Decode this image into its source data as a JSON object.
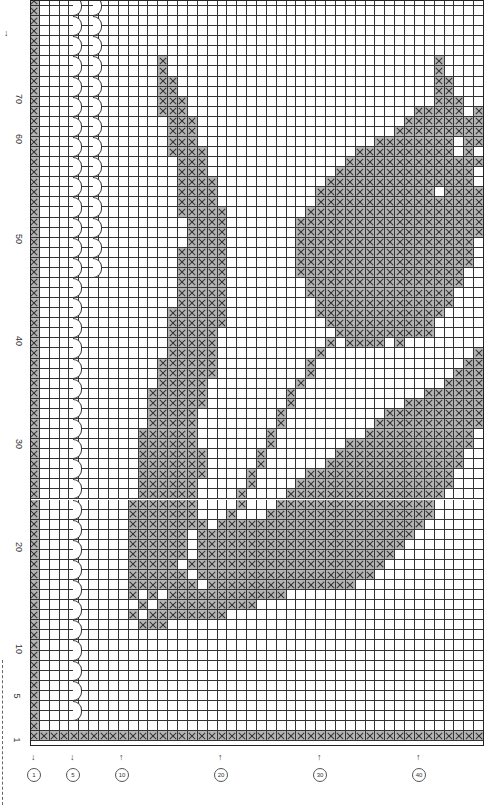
{
  "chart": {
    "cols": 46,
    "rows": 74,
    "cell_w": 9.87,
    "cell_h": 10.07,
    "fill_color": "#b4b4b4",
    "line_color": "#333333",
    "row_labels": [
      {
        "text": "70",
        "y": 100
      },
      {
        "text": "60",
        "y": 140
      },
      {
        "text": "50",
        "y": 240
      },
      {
        "text": "40",
        "y": 342
      },
      {
        "text": "30",
        "y": 445
      },
      {
        "text": "20",
        "y": 548
      },
      {
        "text": "10",
        "y": 650
      },
      {
        "text": "5",
        "y": 697
      },
      {
        "text": "1",
        "y": 741
      }
    ],
    "col_labels": [
      {
        "text": "1",
        "x": 34,
        "dir": "↓"
      },
      {
        "text": "5",
        "x": 73,
        "dir": "↓"
      },
      {
        "text": "10",
        "x": 122,
        "dir": "↑"
      },
      {
        "text": "20",
        "x": 221,
        "dir": "↑"
      },
      {
        "text": "30",
        "x": 320,
        "dir": "↑"
      },
      {
        "text": "40",
        "x": 419,
        "dir": "↑"
      }
    ],
    "top_arrow": {
      "text": "↓",
      "x": 4,
      "y": 28
    },
    "arc_columns": [
      {
        "col": 5,
        "from_row": 0,
        "to_row": 71,
        "step": 2
      },
      {
        "col": 7,
        "from_row": 0,
        "to_row": 27,
        "step": 2
      }
    ],
    "filled": [
      [
        6,
        [
          [
            13,
            13
          ],
          [
            41,
            41
          ]
        ]
      ],
      [
        7,
        [
          [
            13,
            13
          ],
          [
            41,
            41
          ]
        ]
      ],
      [
        8,
        [
          [
            13,
            14
          ],
          [
            41,
            42
          ]
        ]
      ],
      [
        9,
        [
          [
            13,
            14
          ],
          [
            41,
            42
          ]
        ]
      ],
      [
        10,
        [
          [
            13,
            15
          ],
          [
            41,
            43
          ]
        ]
      ],
      [
        11,
        [
          [
            13,
            15
          ],
          [
            39,
            43
          ],
          [
            45,
            45
          ]
        ]
      ],
      [
        12,
        [
          [
            14,
            16
          ],
          [
            38,
            43
          ],
          [
            44,
            45
          ]
        ]
      ],
      [
        13,
        [
          [
            14,
            16
          ],
          [
            37,
            43
          ],
          [
            44,
            45
          ]
        ]
      ],
      [
        14,
        [
          [
            14,
            16
          ],
          [
            35,
            42
          ],
          [
            44,
            45
          ]
        ]
      ],
      [
        15,
        [
          [
            14,
            17
          ],
          [
            33,
            42
          ],
          [
            44,
            44
          ]
        ]
      ],
      [
        16,
        [
          [
            15,
            17
          ],
          [
            32,
            43
          ],
          [
            44,
            45
          ]
        ]
      ],
      [
        17,
        [
          [
            15,
            17
          ],
          [
            31,
            44
          ]
        ]
      ],
      [
        18,
        [
          [
            15,
            18
          ],
          [
            30,
            44
          ]
        ]
      ],
      [
        19,
        [
          [
            15,
            18
          ],
          [
            29,
            40
          ],
          [
            42,
            45
          ]
        ]
      ],
      [
        20,
        [
          [
            15,
            18
          ],
          [
            29,
            45
          ]
        ]
      ],
      [
        21,
        [
          [
            15,
            19
          ],
          [
            28,
            45
          ]
        ]
      ],
      [
        22,
        [
          [
            16,
            19
          ],
          [
            27,
            45
          ]
        ]
      ],
      [
        23,
        [
          [
            16,
            19
          ],
          [
            27,
            45
          ]
        ]
      ],
      [
        24,
        [
          [
            16,
            19
          ],
          [
            27,
            44
          ]
        ]
      ],
      [
        25,
        [
          [
            15,
            19
          ],
          [
            27,
            44
          ]
        ]
      ],
      [
        26,
        [
          [
            15,
            19
          ],
          [
            27,
            44
          ]
        ]
      ],
      [
        27,
        [
          [
            15,
            19
          ],
          [
            27,
            43
          ]
        ]
      ],
      [
        28,
        [
          [
            15,
            19
          ],
          [
            28,
            43
          ]
        ]
      ],
      [
        29,
        [
          [
            15,
            19
          ],
          [
            28,
            42
          ]
        ]
      ],
      [
        30,
        [
          [
            15,
            19
          ],
          [
            29,
            42
          ]
        ]
      ],
      [
        31,
        [
          [
            14,
            19
          ],
          [
            29,
            41
          ]
        ]
      ],
      [
        32,
        [
          [
            14,
            19
          ],
          [
            30,
            40
          ]
        ]
      ],
      [
        33,
        [
          [
            14,
            18
          ],
          [
            31,
            40
          ]
        ]
      ],
      [
        34,
        [
          [
            14,
            18
          ],
          [
            30,
            30
          ],
          [
            32,
            35
          ],
          [
            37,
            37
          ]
        ]
      ],
      [
        35,
        [
          [
            14,
            18
          ],
          [
            29,
            29
          ],
          [
            45,
            45
          ]
        ]
      ],
      [
        36,
        [
          [
            13,
            18
          ],
          [
            28,
            28
          ],
          [
            44,
            45
          ]
        ]
      ],
      [
        37,
        [
          [
            13,
            18
          ],
          [
            28,
            28
          ],
          [
            43,
            45
          ]
        ]
      ],
      [
        38,
        [
          [
            13,
            17
          ],
          [
            27,
            27
          ],
          [
            42,
            45
          ]
        ]
      ],
      [
        39,
        [
          [
            12,
            17
          ],
          [
            26,
            26
          ],
          [
            40,
            45
          ]
        ]
      ],
      [
        40,
        [
          [
            12,
            17
          ],
          [
            26,
            26
          ],
          [
            38,
            45
          ]
        ]
      ],
      [
        41,
        [
          [
            12,
            16
          ],
          [
            25,
            25
          ],
          [
            36,
            45
          ]
        ]
      ],
      [
        42,
        [
          [
            12,
            16
          ],
          [
            25,
            25
          ],
          [
            35,
            45
          ]
        ]
      ],
      [
        43,
        [
          [
            11,
            16
          ],
          [
            24,
            24
          ],
          [
            34,
            44
          ]
        ]
      ],
      [
        44,
        [
          [
            11,
            16
          ],
          [
            24,
            24
          ],
          [
            32,
            44
          ]
        ]
      ],
      [
        45,
        [
          [
            11,
            17
          ],
          [
            23,
            23
          ],
          [
            31,
            43
          ]
        ]
      ],
      [
        46,
        [
          [
            11,
            17
          ],
          [
            23,
            23
          ],
          [
            30,
            43
          ]
        ]
      ],
      [
        47,
        [
          [
            11,
            17
          ],
          [
            22,
            22
          ],
          [
            28,
            42
          ]
        ]
      ],
      [
        48,
        [
          [
            11,
            16
          ],
          [
            22,
            22
          ],
          [
            27,
            42
          ]
        ]
      ],
      [
        49,
        [
          [
            11,
            16
          ],
          [
            21,
            21
          ],
          [
            26,
            41
          ]
        ]
      ],
      [
        50,
        [
          [
            10,
            16
          ],
          [
            21,
            21
          ],
          [
            25,
            40
          ]
        ]
      ],
      [
        51,
        [
          [
            10,
            16
          ],
          [
            20,
            20
          ],
          [
            24,
            40
          ]
        ]
      ],
      [
        52,
        [
          [
            10,
            17
          ],
          [
            19,
            39
          ]
        ]
      ],
      [
        53,
        [
          [
            10,
            15
          ],
          [
            17,
            38
          ]
        ]
      ],
      [
        54,
        [
          [
            10,
            15
          ],
          [
            17,
            37
          ]
        ]
      ],
      [
        55,
        [
          [
            10,
            15
          ],
          [
            17,
            36
          ]
        ]
      ],
      [
        56,
        [
          [
            10,
            14
          ],
          [
            16,
            35
          ]
        ]
      ],
      [
        57,
        [
          [
            10,
            15
          ],
          [
            17,
            34
          ]
        ]
      ],
      [
        58,
        [
          [
            10,
            16
          ],
          [
            18,
            32
          ]
        ]
      ],
      [
        59,
        [
          [
            10,
            10
          ],
          [
            12,
            12
          ],
          [
            14,
            25
          ]
        ]
      ],
      [
        60,
        [
          [
            11,
            11
          ],
          [
            13,
            22
          ]
        ]
      ],
      [
        61,
        [
          [
            10,
            10
          ],
          [
            12,
            19
          ]
        ]
      ],
      [
        62,
        [
          [
            11,
            13
          ]
        ]
      ]
    ]
  }
}
